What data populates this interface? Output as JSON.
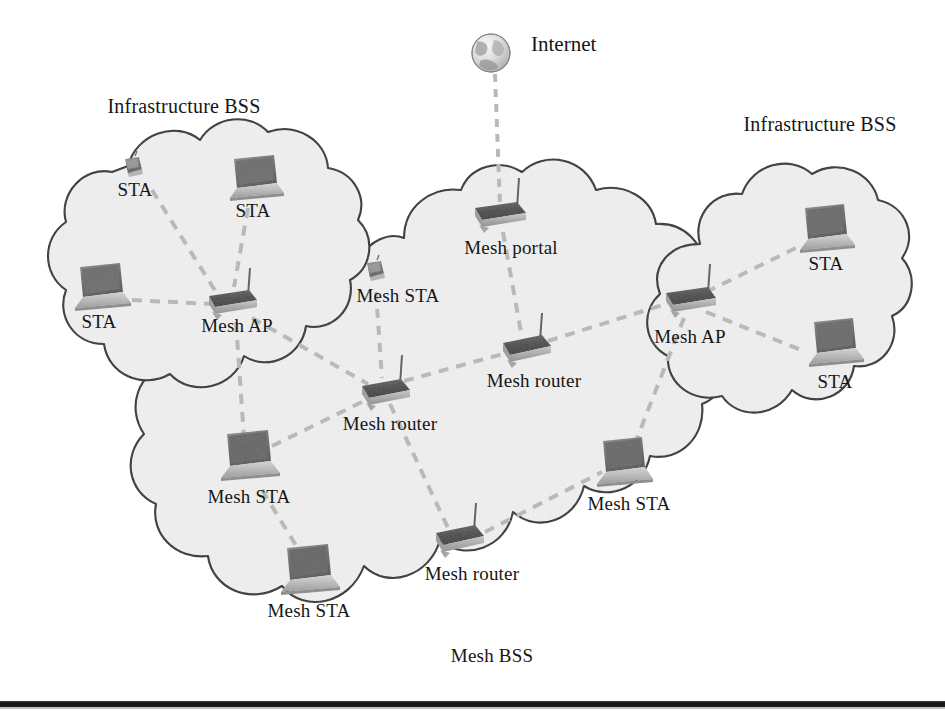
{
  "figure": {
    "kind": "network-topology-diagram",
    "background_color": "#ffffff",
    "cloud_fill_color": "#f0f0f0",
    "cloud_stroke_color": "#2b2b2b",
    "link_color": "#b9b9b9",
    "text_color": "#161616"
  },
  "clouds": [
    {
      "id": "bss-left",
      "label": "Infrastructure BSS",
      "label_x": 184,
      "label_y": 96
    },
    {
      "id": "bss-right",
      "label": "Infrastructure BSS",
      "label_x": 820,
      "label_y": 114
    },
    {
      "id": "mesh-bss",
      "label": "Mesh BSS",
      "label_x": 492,
      "label_y": 646
    }
  ],
  "internet": {
    "label": "Internet",
    "icon": "globe-icon",
    "label_x": 531,
    "label_y": 34,
    "cx": 491,
    "cy": 53,
    "r": 19
  },
  "nodes": [
    {
      "id": "sta-l-handheld",
      "label": "STA",
      "icon": "handheld-device-icon",
      "x": 133,
      "y": 168,
      "label_x": 135,
      "label_y": 180,
      "cloud": "bss-left"
    },
    {
      "id": "sta-l-top",
      "label": "STA",
      "icon": "laptop-icon",
      "x": 253,
      "y": 177,
      "label_x": 253,
      "label_y": 201,
      "cloud": "bss-left"
    },
    {
      "id": "sta-l-left",
      "label": "STA",
      "icon": "laptop-icon",
      "x": 99,
      "y": 287,
      "label_x": 99,
      "label_y": 312,
      "cloud": "bss-left"
    },
    {
      "id": "mesh-ap-left",
      "label": "Mesh AP",
      "icon": "wireless-router-icon",
      "x": 231,
      "y": 302,
      "label_x": 237,
      "label_y": 316,
      "cloud": "bss-left"
    },
    {
      "id": "mesh-sta-hand",
      "label": "Mesh STA",
      "icon": "handheld-device-icon",
      "x": 375,
      "y": 272,
      "label_x": 398,
      "label_y": 286,
      "cloud": "mesh-bss"
    },
    {
      "id": "mesh-portal",
      "label": "Mesh portal",
      "icon": "wireless-router-icon",
      "x": 499,
      "y": 215,
      "label_x": 511,
      "label_y": 238,
      "cloud": "mesh-bss"
    },
    {
      "id": "mesh-router-c",
      "label": "Mesh router",
      "icon": "wireless-router-icon",
      "x": 386,
      "y": 392,
      "label_x": 390,
      "label_y": 414,
      "cloud": "mesh-bss"
    },
    {
      "id": "mesh-router-ne",
      "label": "Mesh router",
      "icon": "wireless-router-icon",
      "x": 528,
      "y": 349,
      "label_x": 534,
      "label_y": 371,
      "cloud": "mesh-bss"
    },
    {
      "id": "mesh-ap-right",
      "label": "Mesh AP",
      "icon": "wireless-router-icon",
      "x": 690,
      "y": 300,
      "label_x": 690,
      "label_y": 327,
      "cloud": "bss-right"
    },
    {
      "id": "sta-r-top",
      "label": "STA",
      "icon": "laptop-icon",
      "x": 824,
      "y": 230,
      "label_x": 826,
      "label_y": 254,
      "cloud": "bss-right"
    },
    {
      "id": "sta-r-bot",
      "label": "STA",
      "icon": "laptop-icon",
      "x": 833,
      "y": 344,
      "label_x": 835,
      "label_y": 372,
      "cloud": "bss-right"
    },
    {
      "id": "mesh-sta-w",
      "label": "Mesh STA",
      "icon": "laptop-icon",
      "x": 247,
      "y": 457,
      "label_x": 249,
      "label_y": 487,
      "cloud": "mesh-bss"
    },
    {
      "id": "mesh-sta-sw",
      "label": "Mesh STA",
      "icon": "laptop-icon",
      "x": 307,
      "y": 571,
      "label_x": 309,
      "label_y": 601,
      "cloud": "mesh-bss"
    },
    {
      "id": "mesh-router-s",
      "label": "Mesh router",
      "icon": "wireless-router-icon",
      "x": 461,
      "y": 539,
      "label_x": 472,
      "label_y": 564,
      "cloud": "mesh-bss"
    },
    {
      "id": "mesh-sta-e",
      "label": "Mesh STA",
      "icon": "laptop-icon",
      "x": 622,
      "y": 463,
      "label_x": 629,
      "label_y": 494,
      "cloud": "mesh-bss"
    }
  ],
  "links": [
    {
      "from": "internet",
      "to": "mesh-portal",
      "style": "dashed"
    },
    {
      "from": "sta-l-handheld",
      "to": "mesh-ap-left",
      "style": "dashed"
    },
    {
      "from": "sta-l-top",
      "to": "mesh-ap-left",
      "style": "dashed"
    },
    {
      "from": "sta-l-left",
      "to": "mesh-ap-left",
      "style": "dashed"
    },
    {
      "from": "mesh-ap-left",
      "to": "mesh-router-c",
      "style": "dashed"
    },
    {
      "from": "mesh-ap-left",
      "to": "mesh-sta-w",
      "style": "dashed"
    },
    {
      "from": "mesh-sta-hand",
      "to": "mesh-router-c",
      "style": "dashed"
    },
    {
      "from": "mesh-portal",
      "to": "mesh-router-ne",
      "style": "dashed"
    },
    {
      "from": "mesh-router-c",
      "to": "mesh-router-ne",
      "style": "dashed"
    },
    {
      "from": "mesh-router-c",
      "to": "mesh-router-s",
      "style": "dashed"
    },
    {
      "from": "mesh-router-ne",
      "to": "mesh-ap-right",
      "style": "dashed"
    },
    {
      "from": "mesh-ap-right",
      "to": "sta-r-top",
      "style": "dashed"
    },
    {
      "from": "mesh-ap-right",
      "to": "sta-r-bot",
      "style": "dashed"
    },
    {
      "from": "mesh-ap-right",
      "to": "mesh-sta-e",
      "style": "dashed"
    },
    {
      "from": "mesh-sta-w",
      "to": "mesh-router-c",
      "style": "dashed"
    },
    {
      "from": "mesh-sta-w",
      "to": "mesh-sta-sw",
      "style": "dashed"
    },
    {
      "from": "mesh-router-s",
      "to": "mesh-sta-e",
      "style": "dashed"
    }
  ],
  "footer_rule": {
    "y": 701,
    "height": 6,
    "color": "#141414"
  }
}
